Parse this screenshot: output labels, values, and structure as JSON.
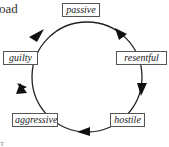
{
  "fragments": {
    "top_left": "oad",
    "bottom_left": "rr"
  },
  "diagram": {
    "type": "cycle",
    "direction": "clockwise",
    "nodes": [
      {
        "id": "passive",
        "label": "passive"
      },
      {
        "id": "resentful",
        "label": "resentful"
      },
      {
        "id": "hostile",
        "label": "hostile"
      },
      {
        "id": "aggressive",
        "label": "aggressive"
      },
      {
        "id": "guilty",
        "label": "guilty"
      }
    ],
    "edges": [
      {
        "from": "passive",
        "to": "resentful"
      },
      {
        "from": "resentful",
        "to": "hostile"
      },
      {
        "from": "hostile",
        "to": "aggressive"
      },
      {
        "from": "aggressive",
        "to": "guilty"
      },
      {
        "from": "guilty",
        "to": "passive"
      }
    ]
  }
}
